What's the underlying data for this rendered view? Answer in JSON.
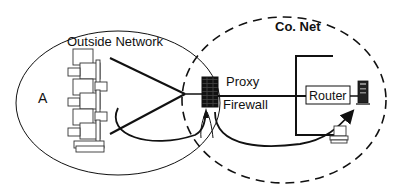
{
  "diagram": {
    "outside_network": {
      "label": "Outside Network",
      "host_label": "A"
    },
    "company_network": {
      "label": "Co. Net"
    },
    "gateway": {
      "proxy_label": "Proxy",
      "firewall_label": "Firewall"
    },
    "router": {
      "label": "Router"
    },
    "colors": {
      "stroke": "#111111",
      "background": "#ffffff"
    }
  }
}
